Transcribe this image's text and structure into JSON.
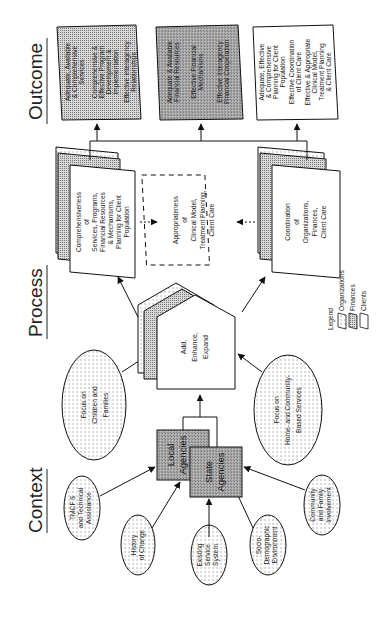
{
  "diagram": {
    "orientation": "rotated 90 degrees counter-clockwise",
    "columns": {
      "context": "Context",
      "process": "Process",
      "outcome": "Outcome"
    },
    "context": {
      "agencies": {
        "local": [
          "Local",
          "Agencies"
        ],
        "state": [
          "State",
          "Agencies"
        ]
      },
      "influences": [
        {
          "lines": [
            "TMCF $",
            "and Technical",
            "Assistance"
          ]
        },
        {
          "lines": [
            "History",
            "of Change"
          ]
        },
        {
          "lines": [
            "Existing",
            "Service",
            "System"
          ]
        },
        {
          "lines": [
            "Socio-",
            "Demographic",
            "Environment"
          ]
        },
        {
          "lines": [
            "Community",
            "and Family",
            "Involvement"
          ]
        }
      ],
      "focus": [
        {
          "lines": [
            "Focus on",
            "Children and",
            "Families"
          ]
        },
        {
          "lines": [
            "Focus on",
            "Home- and Community-",
            "Based Services"
          ]
        }
      ]
    },
    "process": {
      "core": {
        "lines": [
          "Add,",
          "Enhance,",
          "Expand"
        ]
      },
      "boxes": [
        {
          "lines": [
            "Comprehensiveness",
            "of",
            "Services, Programs,",
            "Financial Resources",
            "& Mechanisms,",
            "Planning for Client",
            "Population"
          ]
        },
        {
          "lines": [
            "Appropriateness",
            "of",
            "Clinical Model,",
            "Treatment Planning,",
            "Client Care"
          ]
        },
        {
          "lines": [
            "Coordination",
            "of",
            "Organizations,",
            "Finances,",
            "Client Care"
          ]
        }
      ]
    },
    "outcome": {
      "boxes": [
        {
          "type": "organizations",
          "lines": [
            "Adequate, Available",
            "& Comprehensive",
            "Services",
            "",
            "Comprehensive &",
            "Effective Program",
            "Development &",
            "Implementation",
            "",
            "Effective Interagency",
            "Relationships"
          ]
        },
        {
          "type": "finances",
          "lines": [
            "Adequate & Available",
            "Financial Resources",
            "",
            "Effective Financial",
            "Mechanisms",
            "",
            "Effective Interagency",
            "Financial Cooperation"
          ]
        },
        {
          "type": "clients",
          "lines": [
            "Adequate, Effective",
            "& Comprehensive",
            "Planning for Client",
            "Population",
            "Effective Coordination",
            "of Client Care",
            "Effective & Appropriate",
            "Clinical Model,",
            "Treatment Planning",
            "& Client Care"
          ]
        }
      ]
    },
    "legend": {
      "title": "Legend",
      "items": [
        "Organizations",
        "Finances",
        "Clients"
      ]
    }
  }
}
